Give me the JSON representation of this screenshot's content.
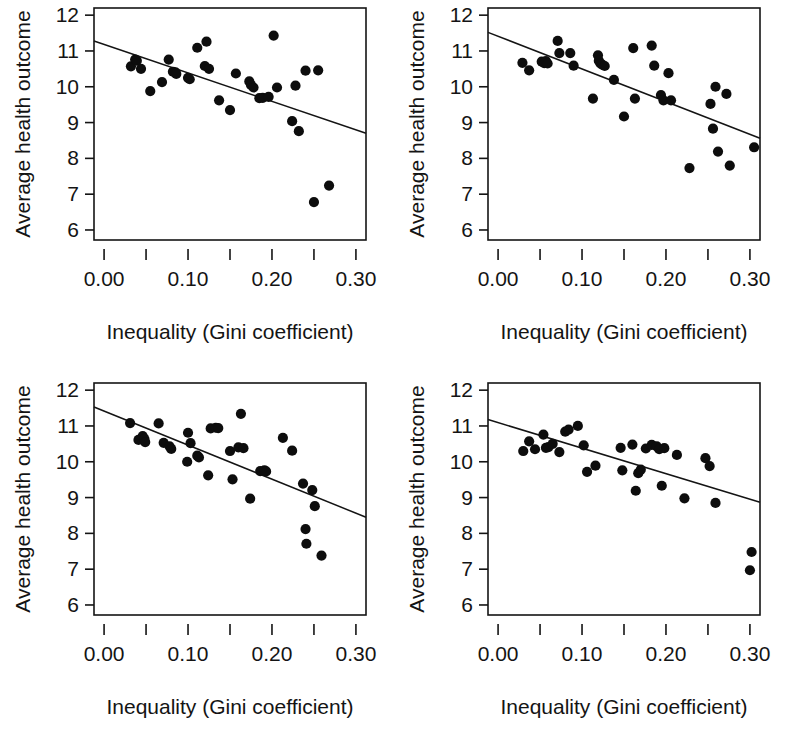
{
  "figure": {
    "type": "scatter-matrix",
    "panel_count": 4,
    "shared_xlabel": "Inequality (Gini coefficient)",
    "shared_ylabel": "Average health outcome",
    "background_color": "#ffffff",
    "point_color": "#0d0d0d",
    "line_color": "#141414"
  },
  "axes": {
    "x_tick_labels": [
      "0.00",
      "0.10",
      "0.20",
      "0.30"
    ],
    "x_tick_values": [
      0.0,
      0.1,
      0.2,
      0.3
    ],
    "x_minor_tick_values": [
      0.05,
      0.15,
      0.25
    ],
    "y_tick_labels": [
      "6",
      "7",
      "8",
      "9",
      "10",
      "11",
      "12"
    ],
    "y_tick_values": [
      6,
      7,
      8,
      9,
      10,
      11,
      12
    ],
    "xlim": [
      -0.012,
      0.312
    ],
    "ylim": [
      5.72,
      12.2
    ],
    "grid": false
  },
  "chart_data": [
    {
      "type": "scatter",
      "panel": "top-left",
      "title": "",
      "xlabel": "Inequality (Gini coefficient)",
      "ylabel": "Average health outcome",
      "xlim": [
        -0.012,
        0.312
      ],
      "ylim": [
        5.72,
        12.2
      ],
      "xticks": [
        0.0,
        0.1,
        0.2,
        0.3
      ],
      "yticks": [
        6,
        7,
        8,
        9,
        10,
        11,
        12
      ],
      "grid": false,
      "x": [
        0.032,
        0.037,
        0.039,
        0.044,
        0.055,
        0.069,
        0.077,
        0.082,
        0.085,
        0.086,
        0.1,
        0.102,
        0.111,
        0.12,
        0.122,
        0.125,
        0.137,
        0.15,
        0.157,
        0.173,
        0.175,
        0.178,
        0.185,
        0.189,
        0.196,
        0.202,
        0.206,
        0.224,
        0.228,
        0.232,
        0.24,
        0.25,
        0.255,
        0.268
      ],
      "y": [
        10.57,
        10.76,
        10.73,
        10.5,
        9.88,
        10.13,
        10.76,
        10.42,
        10.4,
        10.36,
        10.25,
        10.21,
        11.09,
        10.58,
        11.26,
        10.5,
        9.62,
        9.35,
        10.37,
        10.15,
        10.05,
        9.98,
        9.68,
        9.69,
        9.72,
        11.43,
        9.98,
        9.04,
        10.03,
        8.76,
        10.45,
        6.78,
        10.46,
        7.24
      ],
      "fit_line": {
        "x0": -0.012,
        "y0": 11.28,
        "x1": 0.312,
        "y1": 8.7
      },
      "series": [
        {
          "name": "countries",
          "marker": "filled-circle"
        }
      ]
    },
    {
      "type": "scatter",
      "panel": "top-right",
      "title": "",
      "xlabel": "Inequality (Gini coefficient)",
      "ylabel": "Average health outcome",
      "xlim": [
        -0.012,
        0.312
      ],
      "ylim": [
        5.72,
        12.2
      ],
      "xticks": [
        0.0,
        0.1,
        0.2,
        0.3
      ],
      "yticks": [
        6,
        7,
        8,
        9,
        10,
        11,
        12
      ],
      "grid": false,
      "x": [
        0.029,
        0.037,
        0.052,
        0.055,
        0.057,
        0.059,
        0.071,
        0.073,
        0.086,
        0.09,
        0.113,
        0.119,
        0.12,
        0.122,
        0.124,
        0.127,
        0.138,
        0.15,
        0.161,
        0.163,
        0.183,
        0.186,
        0.194,
        0.197,
        0.203,
        0.206,
        0.228,
        0.253,
        0.256,
        0.259,
        0.262,
        0.272,
        0.276,
        0.305
      ],
      "y": [
        10.67,
        10.46,
        10.7,
        10.66,
        10.72,
        10.65,
        11.28,
        10.94,
        10.94,
        10.59,
        9.67,
        10.88,
        10.73,
        10.65,
        10.62,
        10.58,
        10.19,
        9.17,
        11.08,
        9.67,
        11.15,
        10.59,
        9.77,
        9.62,
        10.38,
        9.62,
        7.73,
        9.52,
        8.83,
        10.0,
        8.19,
        9.8,
        7.8,
        8.31
      ],
      "fit_line": {
        "x0": -0.012,
        "y0": 11.52,
        "x1": 0.312,
        "y1": 8.56
      },
      "series": [
        {
          "name": "countries",
          "marker": "filled-circle"
        }
      ]
    },
    {
      "type": "scatter",
      "panel": "bottom-left",
      "title": "",
      "xlabel": "Inequality (Gini coefficient)",
      "ylabel": "Average health outcome",
      "xlim": [
        -0.012,
        0.312
      ],
      "ylim": [
        5.72,
        12.2
      ],
      "xticks": [
        0.0,
        0.1,
        0.2,
        0.3
      ],
      "yticks": [
        6,
        7,
        8,
        9,
        10,
        11,
        12
      ],
      "grid": false,
      "x": [
        0.031,
        0.041,
        0.046,
        0.048,
        0.049,
        0.065,
        0.071,
        0.078,
        0.08,
        0.099,
        0.1,
        0.103,
        0.111,
        0.113,
        0.124,
        0.127,
        0.133,
        0.136,
        0.15,
        0.153,
        0.16,
        0.163,
        0.166,
        0.174,
        0.186,
        0.191,
        0.193,
        0.213,
        0.224,
        0.237,
        0.24,
        0.241,
        0.248,
        0.251,
        0.259
      ],
      "y": [
        11.08,
        10.61,
        10.72,
        10.64,
        10.55,
        11.07,
        10.53,
        10.43,
        10.36,
        10.0,
        10.81,
        10.52,
        10.17,
        10.12,
        9.62,
        10.93,
        10.95,
        10.94,
        10.3,
        9.51,
        10.4,
        11.34,
        10.38,
        8.97,
        9.74,
        9.76,
        9.73,
        10.67,
        10.31,
        9.39,
        8.12,
        7.71,
        9.21,
        8.76,
        7.38
      ],
      "fit_line": {
        "x0": -0.012,
        "y0": 11.53,
        "x1": 0.312,
        "y1": 8.45
      },
      "series": [
        {
          "name": "countries",
          "marker": "filled-circle"
        }
      ]
    },
    {
      "type": "scatter",
      "panel": "bottom-right",
      "title": "",
      "xlabel": "Inequality (Gini coefficient)",
      "ylabel": "Average health outcome",
      "xlim": [
        -0.012,
        0.312
      ],
      "ylim": [
        5.72,
        12.2
      ],
      "xticks": [
        0.0,
        0.1,
        0.2,
        0.3
      ],
      "yticks": [
        6,
        7,
        8,
        9,
        10,
        11,
        12
      ],
      "grid": false,
      "x": [
        0.03,
        0.037,
        0.044,
        0.054,
        0.057,
        0.06,
        0.065,
        0.073,
        0.08,
        0.084,
        0.095,
        0.102,
        0.106,
        0.116,
        0.146,
        0.148,
        0.16,
        0.164,
        0.167,
        0.17,
        0.176,
        0.183,
        0.189,
        0.192,
        0.195,
        0.198,
        0.213,
        0.222,
        0.247,
        0.252,
        0.259,
        0.3,
        0.302
      ],
      "y": [
        10.3,
        10.57,
        10.35,
        10.76,
        10.39,
        10.41,
        10.5,
        10.27,
        10.84,
        10.9,
        11.0,
        10.46,
        9.72,
        9.89,
        10.39,
        9.76,
        10.48,
        9.19,
        9.68,
        9.78,
        10.37,
        10.47,
        10.43,
        10.35,
        9.33,
        10.38,
        10.19,
        8.98,
        10.1,
        9.88,
        8.85,
        6.97,
        7.48
      ],
      "fit_line": {
        "x0": -0.012,
        "y0": 11.18,
        "x1": 0.312,
        "y1": 8.87
      },
      "series": [
        {
          "name": "countries",
          "marker": "filled-circle"
        }
      ]
    }
  ]
}
